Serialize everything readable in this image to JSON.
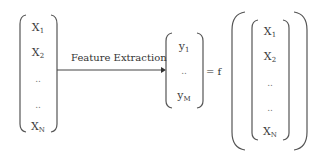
{
  "diagram": {
    "input_vector": {
      "items": [
        {
          "base": "X",
          "sub": "1"
        },
        {
          "base": "X",
          "sub": "2"
        },
        {
          "base": "..",
          "sub": ""
        },
        {
          "base": "..",
          "sub": ""
        },
        {
          "base": "X",
          "sub": "N"
        }
      ]
    },
    "arrow": {
      "label": "Feature Extraction"
    },
    "output_vector": {
      "items": [
        {
          "base": "y",
          "sub": "1"
        },
        {
          "base": "..",
          "sub": ""
        },
        {
          "base": "y",
          "sub": "M"
        }
      ]
    },
    "equals_label": "= f",
    "function_argument_vector": {
      "items": [
        {
          "base": "X",
          "sub": "1"
        },
        {
          "base": "X",
          "sub": "2"
        },
        {
          "base": "..",
          "sub": ""
        },
        {
          "base": "..",
          "sub": ""
        },
        {
          "base": "X",
          "sub": "N"
        }
      ]
    },
    "colors": {
      "stroke": "#555555",
      "text": "#3a3a3a",
      "background": "#ffffff"
    }
  }
}
